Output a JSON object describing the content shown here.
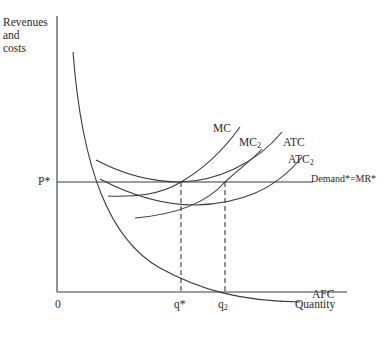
{
  "diagram": {
    "type": "economics-cost-curves",
    "y_axis_label": [
      "Revenues",
      "and",
      "costs"
    ],
    "x_axis_label": "Quantity",
    "origin_label": "0",
    "price_label": "P*",
    "demand_label": "Demand*=MR*",
    "curves": [
      {
        "id": "mc",
        "label": "MC"
      },
      {
        "id": "mc2",
        "label": "MC",
        "subscript": "2"
      },
      {
        "id": "atc",
        "label": "ATC"
      },
      {
        "id": "atc2",
        "label": "ATC",
        "subscript": "2"
      },
      {
        "id": "afc",
        "label": "AFC"
      }
    ],
    "quantity_markers": [
      {
        "id": "q-star",
        "label": "q*"
      },
      {
        "id": "q2",
        "label": "q",
        "subscript": "2"
      }
    ]
  }
}
